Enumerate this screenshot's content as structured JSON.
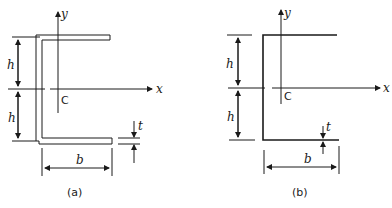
{
  "figure_a": {
    "caption": "(a)",
    "axis_x_label": "x",
    "axis_y_label": "y",
    "centroid_label": "C",
    "dim_h_upper": "h",
    "dim_h_lower": "h",
    "dim_b": "b",
    "dim_t": "t",
    "section": "channel section with finite wall thickness"
  },
  "figure_b": {
    "caption": "(b)",
    "axis_x_label": "x",
    "axis_y_label": "y",
    "centroid_label": "C",
    "dim_h_upper": "h",
    "dim_h_lower": "h",
    "dim_b": "b",
    "dim_t": "t",
    "section": "thin-walled channel section (centerline)"
  }
}
